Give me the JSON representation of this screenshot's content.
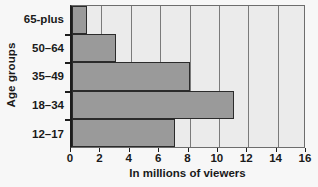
{
  "chart_data": {
    "type": "bar",
    "orientation": "horizontal",
    "title": "",
    "xlabel": "In millions of viewers",
    "ylabel": "Age groups",
    "categories": [
      "65-plus",
      "50–64",
      "35–49",
      "18–34",
      "12–17"
    ],
    "values": [
      1,
      3,
      8,
      11,
      7
    ],
    "xlim": [
      0,
      16
    ],
    "xticks": [
      0,
      2,
      4,
      6,
      8,
      10,
      12,
      14,
      16
    ],
    "xtick_labels": [
      "0",
      "2",
      "4",
      "6",
      "8",
      "10",
      "12",
      "14",
      "16"
    ],
    "grid": "vertical",
    "legend": "none",
    "series": [
      {
        "name": "Viewers",
        "values": [
          1,
          3,
          8,
          11,
          7
        ]
      }
    ],
    "colors": {
      "bar_fill": "#9a9a9a",
      "bar_border": "#2b2b2b",
      "plot_background": "#ebebeb",
      "page_background": "#f7f7f7",
      "gridline": "#7a7a7a",
      "axis": "#1d1d1d",
      "text": "#1a1a1a"
    }
  }
}
